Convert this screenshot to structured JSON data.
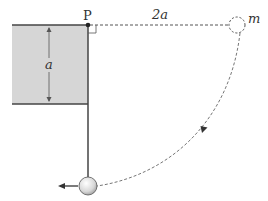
{
  "diagram": {
    "labels": {
      "pivot": "P",
      "horizontal_distance": "2a",
      "block_height": "a",
      "mass": "m"
    },
    "colors": {
      "block_fill": "#d6d6d6",
      "line": "#555555",
      "dashed": "#666666",
      "ball_fill": "#e6e6e6"
    }
  }
}
